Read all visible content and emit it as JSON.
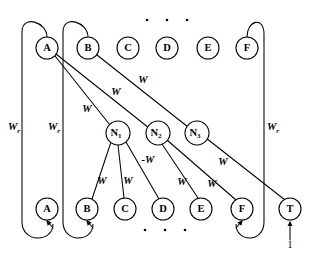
{
  "figure": {
    "background_color": "#ffffff",
    "stroke_color": "#000000",
    "width": 310,
    "height": 255
  },
  "nodes": {
    "top_row": [
      {
        "id": "top-a",
        "label": "A",
        "cx": 47,
        "cy": 48,
        "r": 11
      },
      {
        "id": "top-b",
        "label": "B",
        "cx": 88,
        "cy": 48,
        "r": 11
      },
      {
        "id": "top-c",
        "label": "C",
        "cx": 128,
        "cy": 48,
        "r": 11
      },
      {
        "id": "top-d",
        "label": "D",
        "cx": 167,
        "cy": 48,
        "r": 11
      },
      {
        "id": "top-e",
        "label": "E",
        "cx": 208,
        "cy": 48,
        "r": 11
      },
      {
        "id": "top-f",
        "label": "F",
        "cx": 247,
        "cy": 48,
        "r": 11
      }
    ],
    "hidden_row": [
      {
        "id": "hid-n1",
        "label": "N",
        "sub": "1",
        "cx": 118,
        "cy": 133,
        "r": 12
      },
      {
        "id": "hid-n2",
        "label": "N",
        "sub": "2",
        "cx": 158,
        "cy": 133,
        "r": 12
      },
      {
        "id": "hid-n3",
        "label": "N",
        "sub": "3",
        "cx": 197,
        "cy": 133,
        "r": 12
      }
    ],
    "bottom_row": [
      {
        "id": "bot-a",
        "label": "A",
        "cx": 47,
        "cy": 209,
        "r": 11
      },
      {
        "id": "bot-b",
        "label": "B",
        "cx": 87,
        "cy": 209,
        "r": 11
      },
      {
        "id": "bot-c",
        "label": "C",
        "cx": 125,
        "cy": 209,
        "r": 11
      },
      {
        "id": "bot-d",
        "label": "D",
        "cx": 163,
        "cy": 209,
        "r": 11
      },
      {
        "id": "bot-e",
        "label": "E",
        "cx": 201,
        "cy": 209,
        "r": 11
      },
      {
        "id": "bot-f",
        "label": "F",
        "cx": 242,
        "cy": 209,
        "r": 11
      },
      {
        "id": "bot-t",
        "label": "T",
        "cx": 290,
        "cy": 209,
        "r": 11
      }
    ]
  },
  "edge_labels": {
    "recurrent": [
      {
        "id": "wr-left-a",
        "text": "W",
        "sub": "r",
        "x": 14,
        "y": 128
      },
      {
        "id": "wr-left-b",
        "text": "W",
        "sub": "r",
        "x": 54,
        "y": 128
      },
      {
        "id": "wr-right-f",
        "text": "W",
        "sub": "r",
        "x": 273,
        "y": 128
      }
    ],
    "input_to_hidden": [
      {
        "id": "w-a-n1",
        "text": "W",
        "x": 87,
        "y": 110
      },
      {
        "id": "w-a-n2",
        "text": "W",
        "x": 116,
        "y": 93
      },
      {
        "id": "w-b-n3",
        "text": "W",
        "x": 143,
        "y": 81
      }
    ],
    "hidden_to_output": [
      {
        "id": "w-n1-b",
        "text": "W",
        "x": 102,
        "y": 182
      },
      {
        "id": "w-n1-c",
        "text": "W",
        "x": 128,
        "y": 182
      },
      {
        "id": "w-n1-d",
        "text": "-W",
        "x": 148,
        "y": 161
      },
      {
        "id": "w-n2-e",
        "text": "W",
        "x": 182,
        "y": 183
      },
      {
        "id": "w-n2-f",
        "text": "W",
        "x": 212,
        "y": 185
      },
      {
        "id": "w-n3-t",
        "text": "W",
        "x": 223,
        "y": 163
      }
    ]
  },
  "annotations": {
    "bias_value": {
      "id": "bias-one",
      "text": "1",
      "x": 290,
      "y": 246
    },
    "top_ellipsis": [
      {
        "cx": 147,
        "cy": 20,
        "r": 1.3
      },
      {
        "cx": 167,
        "cy": 20,
        "r": 1.3
      },
      {
        "cx": 187,
        "cy": 20,
        "r": 1.3
      }
    ],
    "bottom_ellipsis": [
      {
        "cx": 145,
        "cy": 230,
        "r": 1.3
      },
      {
        "cx": 165,
        "cy": 230,
        "r": 1.3
      },
      {
        "cx": 185,
        "cy": 230,
        "r": 1.3
      }
    ]
  }
}
